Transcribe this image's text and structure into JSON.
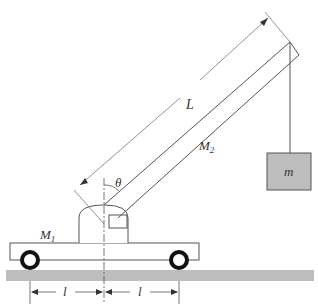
{
  "diagram": {
    "labels": {
      "L": "L",
      "theta": "θ",
      "M2": "M",
      "M2_sub": "2",
      "M1": "M",
      "M1_sub": "1",
      "m": "m",
      "l_left": "l",
      "l_right": "l"
    },
    "colors": {
      "line": "#555555",
      "ground": "#bdbdbd",
      "mass_fill": "#bdbdbd",
      "wheel": "#111111"
    }
  }
}
